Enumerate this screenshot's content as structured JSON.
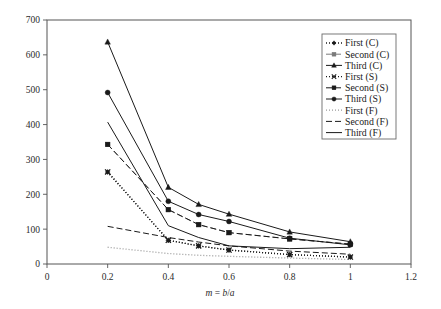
{
  "chart_data": {
    "type": "line",
    "title": "",
    "xlabel": "m = b/a",
    "ylabel": "Frequency",
    "xlim": [
      0,
      1.2
    ],
    "ylim": [
      0,
      700
    ],
    "xticks": [
      "0",
      "0.2",
      "0.4",
      "0.6",
      "0.8",
      "1",
      "1.2"
    ],
    "xtick_values": [
      0,
      0.2,
      0.4,
      0.6,
      0.8,
      1.0,
      1.2
    ],
    "yticks": [
      "0",
      "100",
      "200",
      "300",
      "400",
      "500",
      "600",
      "700"
    ],
    "ytick_values": [
      0,
      100,
      200,
      300,
      400,
      500,
      600,
      700
    ],
    "grid": false,
    "legend_position": "top-right",
    "x": [
      0.2,
      0.4,
      0.5,
      0.6,
      0.8,
      1.0
    ],
    "series": [
      {
        "name": "First (C)",
        "values": [
          264,
          68,
          52,
          40,
          27,
          20
        ],
        "line": "dotted",
        "marker": "diamond",
        "color": "#1a1a1a"
      },
      {
        "name": "Second (C)",
        "values": [
          343,
          156,
          113,
          90,
          72,
          57
        ],
        "line": "dashed",
        "marker": "square",
        "color": "#7a7a7a"
      },
      {
        "name": "Third (C)",
        "values": [
          637,
          220,
          171,
          143,
          92,
          64
        ],
        "line": "solid",
        "marker": "triangle",
        "color": "#1a1a1a"
      },
      {
        "name": "First (S)",
        "values": [
          264,
          68,
          52,
          40,
          27,
          20
        ],
        "line": "dotted",
        "marker": "cross",
        "color": "#1a1a1a"
      },
      {
        "name": "Second (S)",
        "values": [
          343,
          156,
          113,
          90,
          72,
          57
        ],
        "line": "dashed",
        "marker": "square",
        "color": "#1a1a1a"
      },
      {
        "name": "Third (S)",
        "values": [
          492,
          180,
          142,
          122,
          74,
          55
        ],
        "line": "solid",
        "marker": "circle",
        "color": "#1a1a1a"
      },
      {
        "name": "First (F)",
        "values": [
          48,
          30,
          25,
          22,
          17,
          13
        ],
        "line": "dotted",
        "marker": "none",
        "color": "#9a9a9a"
      },
      {
        "name": "Second (F)",
        "values": [
          108,
          76,
          63,
          52,
          37,
          28
        ],
        "line": "dashed",
        "marker": "none",
        "color": "#1a1a1a"
      },
      {
        "name": "Third (F)",
        "values": [
          407,
          110,
          76,
          52,
          44,
          48
        ],
        "line": "solid",
        "marker": "none",
        "color": "#1a1a1a"
      }
    ],
    "legend_entries": [
      {
        "label": "First (C)",
        "line": "dotted",
        "marker": "diamond"
      },
      {
        "label": "Second (C)",
        "line": "dashed",
        "marker": "square"
      },
      {
        "label": "Third (C)",
        "line": "solid",
        "marker": "triangle"
      },
      {
        "label": "First (S)",
        "line": "dotted",
        "marker": "cross"
      },
      {
        "label": "Second (S)",
        "line": "dashed",
        "marker": "square"
      },
      {
        "label": "Third (S)",
        "line": "solid",
        "marker": "circle"
      },
      {
        "label": "First (F)",
        "line": "dotted",
        "marker": "none"
      },
      {
        "label": "Second (F)",
        "line": "dashed",
        "marker": "none"
      },
      {
        "label": "Third (F)",
        "line": "solid",
        "marker": "none"
      }
    ]
  },
  "axis": {
    "ylabel": "Frequency",
    "xlabel_italic_m": "m",
    "xlabel_eq": " = ",
    "xlabel_italic_b": "b",
    "xlabel_slash": "/",
    "xlabel_italic_a": "a"
  }
}
